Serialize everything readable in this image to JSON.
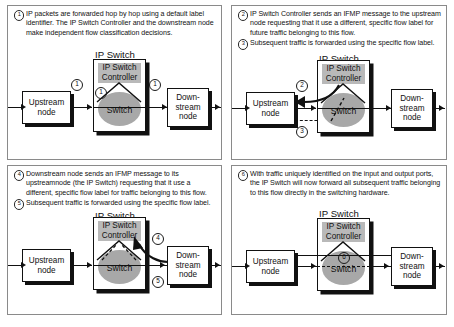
{
  "figure": {
    "panel_count": 4
  },
  "labels": {
    "ip_switch_title": "IP Switch",
    "controller": "IP Switch\nController",
    "controller_line1": "IP Switch",
    "controller_line2": "Controller",
    "switch": "Switch",
    "upstream": "Upstream\nnode",
    "upstream_line1": "Upstream",
    "upstream_line2": "node",
    "downstream_line1": "Down-",
    "downstream_line2": "stream",
    "downstream_line3": "node"
  },
  "colors": {
    "controller_fill": "#b9b9b9",
    "switch_fill": "#a8a8a8",
    "line": "#111111",
    "panel_border": "#8a8a8a",
    "background": "#ffffff"
  },
  "panels": [
    {
      "id": "panel-1",
      "steps": [
        {
          "number": "1",
          "text": "IP packets are forwarded hop by hop using a default label identifier. The IP Switch Controller and the downstream node make independent flow classification decisions."
        }
      ],
      "markers": [
        "1",
        "1",
        "1"
      ]
    },
    {
      "id": "panel-2",
      "steps": [
        {
          "number": "2",
          "text": "IP Switch Controller sends an IFMP message to the upstream node requesting that it use a different, specific flow label for future traffic belonging to this flow."
        },
        {
          "number": "3",
          "text": "Subsequent traffic is forwarded using the specific flow label."
        }
      ],
      "markers": [
        "2",
        "3"
      ]
    },
    {
      "id": "panel-3",
      "steps": [
        {
          "number": "4",
          "text": "Downstream node sends an IFMP message to its upstreamnode (the IP Switch) requesting that it use a different, specific flow label for traffic belonging to this flow."
        },
        {
          "number": "5",
          "text": "Subsequent traffic is forwarded using the specific flow label."
        }
      ],
      "markers": [
        "4",
        "5"
      ]
    },
    {
      "id": "panel-4",
      "steps": [
        {
          "number": "6",
          "text": "With traffic uniquely identified on the input and output ports, the IP Switch will now forward all subsequent traffic belonging to this flow directly in the switching hardware."
        }
      ],
      "markers": [
        "6"
      ]
    }
  ]
}
